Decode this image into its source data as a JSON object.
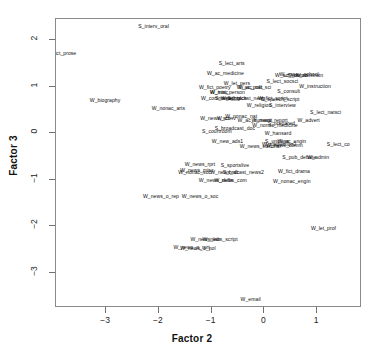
{
  "chart_data": {
    "type": "scatter",
    "title": "",
    "xlabel": "Factor 2",
    "ylabel": "Factor 3",
    "xlim": [
      -3.95,
      1.85
    ],
    "ylim": [
      -3.75,
      2.45
    ],
    "xticks": [
      -3,
      -2,
      -1,
      0,
      1
    ],
    "yticks": [
      2,
      1,
      0,
      -1,
      -2,
      -3
    ],
    "grid": false,
    "legend": null,
    "marker": "text-label",
    "points": [
      {
        "label": "S_interv_oral",
        "x": -2.1,
        "y": 2.28
      },
      {
        "label": "fict_prose",
        "x": -3.78,
        "y": 1.7
      },
      {
        "label": "W_biography",
        "x": -3.02,
        "y": 0.7
      },
      {
        "label": "S_lect_arts",
        "x": -0.62,
        "y": 1.48
      },
      {
        "label": "W_ac_medicine",
        "x": -0.74,
        "y": 1.28
      },
      {
        "label": "W_let_pers",
        "x": -0.52,
        "y": 1.06
      },
      {
        "label": "W_fict_poetry",
        "x": -0.94,
        "y": 0.98
      },
      {
        "label": "W_ac_polit",
        "x": -0.28,
        "y": 0.98
      },
      {
        "label": "W_ac_nat_sci",
        "x": -0.18,
        "y": 0.98
      },
      {
        "label": "S_lect_socsci",
        "x": 0.34,
        "y": 1.1
      },
      {
        "label": "W_ac_soc_sci",
        "x": 0.52,
        "y": 1.22
      },
      {
        "label": "W_essay_school",
        "x": 0.66,
        "y": 1.24
      },
      {
        "label": "S_demonstratn",
        "x": 0.78,
        "y": 1.22
      },
      {
        "label": "W_instruction",
        "x": 0.96,
        "y": 1.0
      },
      {
        "label": "S_consult",
        "x": 0.46,
        "y": 0.88
      },
      {
        "label": "W_misc",
        "x": -0.86,
        "y": 0.86
      },
      {
        "label": "W_inst_person",
        "x": -0.7,
        "y": 0.86
      },
      {
        "label": "W_commerce",
        "x": -0.9,
        "y": 0.74
      },
      {
        "label": "S_meeting",
        "x": -0.7,
        "y": 0.74
      },
      {
        "label": "W_ac_tech",
        "x": -0.58,
        "y": 0.74
      },
      {
        "label": "S_brdcast_news",
        "x": -0.34,
        "y": 0.74
      },
      {
        "label": "W_fict_script",
        "x": 0.16,
        "y": 0.74
      },
      {
        "label": "S_speech_script",
        "x": 0.3,
        "y": 0.72
      },
      {
        "label": "W_religion",
        "x": -0.1,
        "y": 0.58
      },
      {
        "label": "S_interview",
        "x": 0.34,
        "y": 0.58
      },
      {
        "label": "W_nonac_arts",
        "x": -1.82,
        "y": 0.52
      },
      {
        "label": "S_lect_natsci",
        "x": 1.16,
        "y": 0.44
      },
      {
        "label": "W_news_sci",
        "x": -0.94,
        "y": 0.3
      },
      {
        "label": "W_conv",
        "x": -0.72,
        "y": 0.3
      },
      {
        "label": "W_nonac_nat",
        "x": -0.44,
        "y": 0.34
      },
      {
        "label": "W_ac_humanit",
        "x": -0.18,
        "y": 0.26
      },
      {
        "label": "W_news_report",
        "x": 0.1,
        "y": 0.26
      },
      {
        "label": "W_advert",
        "x": 0.84,
        "y": 0.26
      },
      {
        "label": "S_prepared",
        "x": 0.32,
        "y": 0.2
      },
      {
        "label": "W_nonac_medicine",
        "x": 0.2,
        "y": 0.16
      },
      {
        "label": "S_broadcast_doc",
        "x": -0.56,
        "y": 0.1
      },
      {
        "label": "S_courtroom",
        "x": -0.9,
        "y": 0.02
      },
      {
        "label": "W_hansard",
        "x": 0.26,
        "y": -0.02
      },
      {
        "label": "W_new_ads1",
        "x": -0.7,
        "y": -0.18
      },
      {
        "label": "S_unclass",
        "x": 0.24,
        "y": -0.18
      },
      {
        "label": "W_ac_engin",
        "x": 0.52,
        "y": -0.18
      },
      {
        "label": "W_instruction2",
        "x": 0.28,
        "y": -0.26
      },
      {
        "label": "W_news_comm",
        "x": 0.38,
        "y": -0.28
      },
      {
        "label": "S_lect_co",
        "x": 1.4,
        "y": -0.26
      },
      {
        "label": "W_news_editorial",
        "x": -0.08,
        "y": -0.3
      },
      {
        "label": "S_pub_debate",
        "x": 0.66,
        "y": -0.54
      },
      {
        "label": "W_admin",
        "x": 1.02,
        "y": -0.54
      },
      {
        "label": "W_news_rprt",
        "x": -1.22,
        "y": -0.68
      },
      {
        "label": "S_sportslive",
        "x": -0.56,
        "y": -0.7
      },
      {
        "label": "W_news_misc",
        "x": -1.28,
        "y": -0.82
      },
      {
        "label": "W_nonac_soc",
        "x": -1.32,
        "y": -0.86
      },
      {
        "label": "W_news_alt",
        "x": -0.76,
        "y": -0.86
      },
      {
        "label": "S_brdcast_news2",
        "x": -0.4,
        "y": -0.86
      },
      {
        "label": "W_fict_drama",
        "x": 0.56,
        "y": -0.84
      },
      {
        "label": "W_news_skills",
        "x": -0.92,
        "y": -1.02
      },
      {
        "label": "W_news_com",
        "x": -0.64,
        "y": -1.02
      },
      {
        "label": "W_nonac_engin",
        "x": 0.52,
        "y": -1.04
      },
      {
        "label": "W_news_o_rep",
        "x": -1.96,
        "y": -1.36
      },
      {
        "label": "W_news_o_soc",
        "x": -1.22,
        "y": -1.36
      },
      {
        "label": "W_let_prof",
        "x": 1.12,
        "y": -2.06
      },
      {
        "label": "W_news_lab",
        "x": -1.12,
        "y": -2.3
      },
      {
        "label": "W_news_script",
        "x": -0.84,
        "y": -2.3
      },
      {
        "label": "W_news_o_rprt",
        "x": -1.38,
        "y": -2.46
      },
      {
        "label": "W_news_o_pol",
        "x": -1.26,
        "y": -2.48
      },
      {
        "label": "W_email",
        "x": -0.26,
        "y": -3.58
      }
    ]
  }
}
